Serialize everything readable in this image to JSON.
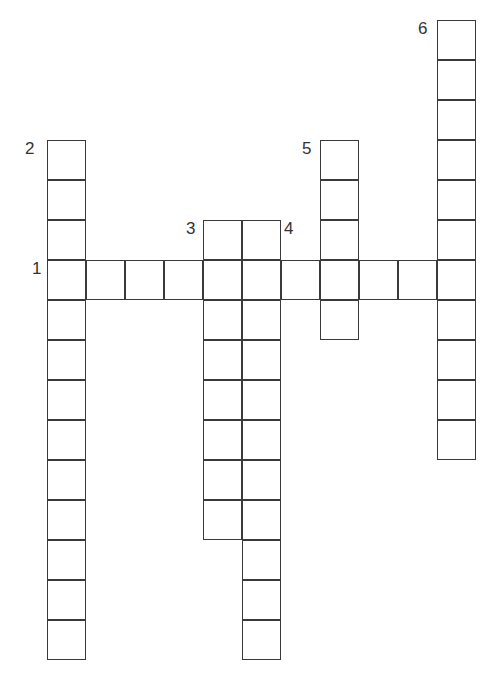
{
  "puzzle": {
    "type": "crossword",
    "cell_size": 39,
    "words": [
      {
        "number": "1",
        "direction": "across",
        "length": 11,
        "col": 0,
        "row": 3
      },
      {
        "number": "2",
        "direction": "down",
        "length": 13,
        "col": 0,
        "row": 0
      },
      {
        "number": "3",
        "direction": "down",
        "length": 8,
        "col": 4,
        "row": 2
      },
      {
        "number": "4",
        "direction": "down",
        "length": 11,
        "col": 5,
        "row": 2
      },
      {
        "number": "5",
        "direction": "down",
        "length": 5,
        "col": 7,
        "row": 0
      },
      {
        "number": "6",
        "direction": "down",
        "length": 11,
        "col": 10,
        "row": -3
      }
    ],
    "labels": [
      {
        "text": "2",
        "x": 25,
        "y": 140
      },
      {
        "text": "1",
        "x": 32,
        "y": 260
      },
      {
        "text": "3",
        "x": 186,
        "y": 220
      },
      {
        "text": "4",
        "x": 284,
        "y": 220
      },
      {
        "text": "5",
        "x": 302,
        "y": 140
      },
      {
        "text": "6",
        "x": 418,
        "y": 20
      }
    ]
  }
}
